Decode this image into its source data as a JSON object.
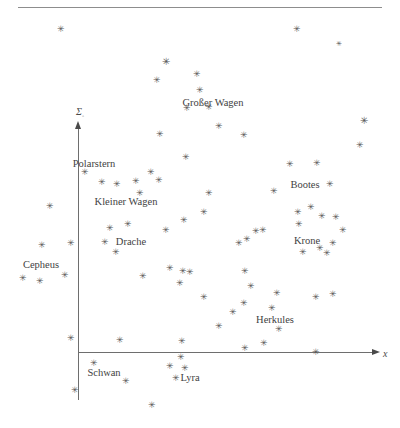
{
  "figure": {
    "title_ghost": "",
    "type": "scatter",
    "background": "#ffffff",
    "star_glyph": "✳",
    "star_color": "#575757",
    "axis_color": "#6e6e6e",
    "label_color": "#3f3f3f"
  },
  "axes": {
    "x": {
      "label": "x",
      "label_subscript": "",
      "start_px": 78,
      "end_px": 372,
      "y_px": 352,
      "arrow": "right"
    },
    "y": {
      "label": "Σ",
      "label_subscript": "◦",
      "x_px": 78,
      "start_px": 400,
      "end_px": 128,
      "arrow": "up"
    }
  },
  "chart_data": {
    "type": "scatter",
    "title": "",
    "xlabel": "x",
    "ylabel": "Σ◦",
    "grid": false,
    "legend": "none",
    "axis_origin": [
      78,
      352
    ],
    "xlim": [
      0,
      400
    ],
    "ylim": [
      428,
      0
    ],
    "annotations": [
      {
        "text": "Großer Wagen",
        "x": 213,
        "y": 102
      },
      {
        "text": "Polarstern",
        "x": 94,
        "y": 163
      },
      {
        "text": "Kleiner Wagen",
        "x": 126,
        "y": 201
      },
      {
        "text": "Bootes",
        "x": 305,
        "y": 184
      },
      {
        "text": "Drache",
        "x": 131,
        "y": 241
      },
      {
        "text": "Cepheus",
        "x": 41,
        "y": 264
      },
      {
        "text": "Krone",
        "x": 307,
        "y": 240
      },
      {
        "text": "Herkules",
        "x": 275,
        "y": 319
      },
      {
        "text": "Schwan",
        "x": 104,
        "y": 372
      },
      {
        "text": "Lyra",
        "x": 190,
        "y": 377
      }
    ],
    "points": [
      {
        "x": 61,
        "y": 29,
        "size": 9
      },
      {
        "x": 297,
        "y": 29,
        "size": 9
      },
      {
        "x": 339,
        "y": 44,
        "size": 7
      },
      {
        "x": 166,
        "y": 62,
        "size": 10
      },
      {
        "x": 197,
        "y": 74,
        "size": 9
      },
      {
        "x": 157,
        "y": 80,
        "size": 9
      },
      {
        "x": 200,
        "y": 90,
        "size": 9
      },
      {
        "x": 364,
        "y": 121,
        "size": 10
      },
      {
        "x": 187,
        "y": 108,
        "size": 9
      },
      {
        "x": 209,
        "y": 107,
        "size": 9
      },
      {
        "x": 219,
        "y": 126,
        "size": 9
      },
      {
        "x": 160,
        "y": 134,
        "size": 9
      },
      {
        "x": 244,
        "y": 135,
        "size": 9
      },
      {
        "x": 360,
        "y": 145,
        "size": 9
      },
      {
        "x": 186,
        "y": 157,
        "size": 9
      },
      {
        "x": 290,
        "y": 164,
        "size": 9
      },
      {
        "x": 317,
        "y": 163,
        "size": 9
      },
      {
        "x": 85,
        "y": 172,
        "size": 9
      },
      {
        "x": 102,
        "y": 182,
        "size": 9
      },
      {
        "x": 117,
        "y": 184,
        "size": 9
      },
      {
        "x": 136,
        "y": 181,
        "size": 9
      },
      {
        "x": 151,
        "y": 172,
        "size": 9
      },
      {
        "x": 159,
        "y": 180,
        "size": 9
      },
      {
        "x": 274,
        "y": 191,
        "size": 9
      },
      {
        "x": 330,
        "y": 184,
        "size": 9
      },
      {
        "x": 140,
        "y": 193,
        "size": 9
      },
      {
        "x": 209,
        "y": 193,
        "size": 9
      },
      {
        "x": 204,
        "y": 212,
        "size": 9
      },
      {
        "x": 50,
        "y": 206,
        "size": 9
      },
      {
        "x": 298,
        "y": 212,
        "size": 9
      },
      {
        "x": 311,
        "y": 207,
        "size": 9
      },
      {
        "x": 322,
        "y": 216,
        "size": 9
      },
      {
        "x": 336,
        "y": 217,
        "size": 9
      },
      {
        "x": 299,
        "y": 224,
        "size": 9
      },
      {
        "x": 343,
        "y": 230,
        "size": 9
      },
      {
        "x": 110,
        "y": 228,
        "size": 9
      },
      {
        "x": 128,
        "y": 224,
        "size": 9
      },
      {
        "x": 166,
        "y": 230,
        "size": 9
      },
      {
        "x": 184,
        "y": 220,
        "size": 9
      },
      {
        "x": 256,
        "y": 231,
        "size": 9
      },
      {
        "x": 239,
        "y": 243,
        "size": 9
      },
      {
        "x": 247,
        "y": 239,
        "size": 9
      },
      {
        "x": 263,
        "y": 230,
        "size": 9
      },
      {
        "x": 42,
        "y": 245,
        "size": 9
      },
      {
        "x": 71,
        "y": 243,
        "size": 9
      },
      {
        "x": 105,
        "y": 242,
        "size": 9
      },
      {
        "x": 116,
        "y": 252,
        "size": 9
      },
      {
        "x": 303,
        "y": 252,
        "size": 9
      },
      {
        "x": 320,
        "y": 248,
        "size": 9
      },
      {
        "x": 327,
        "y": 253,
        "size": 9
      },
      {
        "x": 333,
        "y": 243,
        "size": 9
      },
      {
        "x": 170,
        "y": 268,
        "size": 9
      },
      {
        "x": 183,
        "y": 271,
        "size": 9
      },
      {
        "x": 190,
        "y": 272,
        "size": 9
      },
      {
        "x": 245,
        "y": 271,
        "size": 9
      },
      {
        "x": 23,
        "y": 278,
        "size": 9
      },
      {
        "x": 40,
        "y": 281,
        "size": 9
      },
      {
        "x": 65,
        "y": 275,
        "size": 9
      },
      {
        "x": 143,
        "y": 276,
        "size": 9
      },
      {
        "x": 180,
        "y": 283,
        "size": 9
      },
      {
        "x": 251,
        "y": 286,
        "size": 9
      },
      {
        "x": 277,
        "y": 293,
        "size": 9
      },
      {
        "x": 204,
        "y": 297,
        "size": 9
      },
      {
        "x": 316,
        "y": 297,
        "size": 9
      },
      {
        "x": 333,
        "y": 294,
        "size": 9
      },
      {
        "x": 244,
        "y": 303,
        "size": 9
      },
      {
        "x": 272,
        "y": 308,
        "size": 9
      },
      {
        "x": 233,
        "y": 312,
        "size": 9
      },
      {
        "x": 219,
        "y": 326,
        "size": 9
      },
      {
        "x": 279,
        "y": 329,
        "size": 9
      },
      {
        "x": 71,
        "y": 338,
        "size": 9
      },
      {
        "x": 120,
        "y": 340,
        "size": 9
      },
      {
        "x": 182,
        "y": 341,
        "size": 9
      },
      {
        "x": 264,
        "y": 343,
        "size": 9
      },
      {
        "x": 245,
        "y": 348,
        "size": 9
      },
      {
        "x": 316,
        "y": 352,
        "size": 9
      },
      {
        "x": 94,
        "y": 363,
        "size": 9
      },
      {
        "x": 181,
        "y": 357,
        "size": 9
      },
      {
        "x": 170,
        "y": 366,
        "size": 9
      },
      {
        "x": 185,
        "y": 368,
        "size": 9
      },
      {
        "x": 176,
        "y": 378,
        "size": 9
      },
      {
        "x": 126,
        "y": 381,
        "size": 9
      },
      {
        "x": 75,
        "y": 390,
        "size": 9
      },
      {
        "x": 152,
        "y": 405,
        "size": 9
      }
    ]
  }
}
